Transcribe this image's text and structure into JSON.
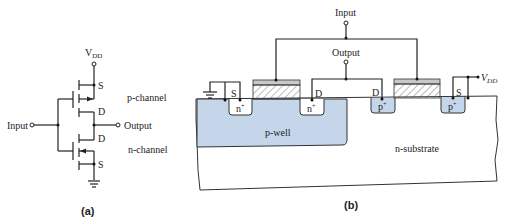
{
  "figure_a": {
    "caption": "(a)",
    "vdd_label": "V",
    "vdd_sub": "DD",
    "input_label": "Input",
    "output_label": "Output",
    "p_channel_label": "p-channel",
    "n_channel_label": "n-channel",
    "p_source": "S",
    "p_drain": "D",
    "n_drain": "D",
    "n_source": "S"
  },
  "figure_b": {
    "caption": "(b)",
    "input_label": "Input",
    "output_label": "Output",
    "vdd_label": "V",
    "vdd_sub": "DD",
    "nmos_source": "S",
    "nmos_drain": "D",
    "pmos_drain": "D",
    "pmos_source": "S",
    "n_plus": "n",
    "p_plus": "p",
    "plus": "+",
    "p_well_label": "p-well",
    "substrate_label": "n-substrate"
  },
  "colors": {
    "well_fill": "#c5d6ea",
    "gate_fill": "#c8c8c8",
    "line": "#222222"
  }
}
